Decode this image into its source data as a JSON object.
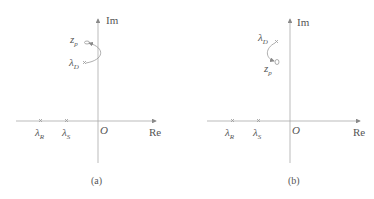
{
  "panels": [
    {
      "caption": "(a)",
      "axes": {
        "x_label": "Re",
        "y_label": "Im",
        "origin_label": "O"
      },
      "points": [
        {
          "symbol": "λ",
          "sub": "R"
        },
        {
          "symbol": "λ",
          "sub": "S"
        },
        {
          "symbol": "λ",
          "sub": "D"
        },
        {
          "symbol": "z",
          "sub": "p"
        }
      ],
      "arrow": "from λ_D to z_p (counter-clockwise bulge right)"
    },
    {
      "caption": "(b)",
      "axes": {
        "x_label": "Re",
        "y_label": "Im",
        "origin_label": "O"
      },
      "points": [
        {
          "symbol": "λ",
          "sub": "R"
        },
        {
          "symbol": "λ",
          "sub": "S"
        },
        {
          "symbol": "λ",
          "sub": "D"
        },
        {
          "symbol": "z",
          "sub": "p"
        }
      ],
      "arrow": "from λ_D to z_p (bulge left)"
    }
  ],
  "colors": {
    "axis": "#9a9a9a",
    "text": "#555555"
  }
}
